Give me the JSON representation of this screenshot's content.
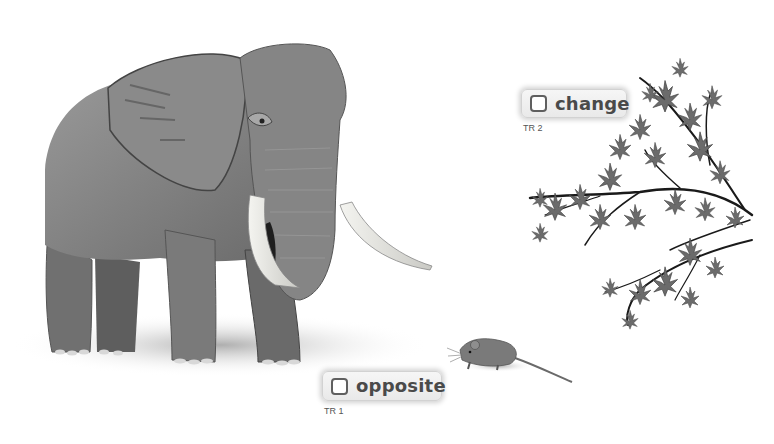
{
  "vocabulary": [
    {
      "word": "change",
      "track": "TR 2",
      "illustration": "maple-branch"
    },
    {
      "word": "opposite",
      "track": "TR 1",
      "illustration": "elephant-and-mouse"
    }
  ],
  "illustrations": {
    "elephant": "elephant-illustration",
    "mouse": "mouse-illustration",
    "branch": "maple-branch-illustration"
  },
  "colors": {
    "elephant_body": "#7c7c7c",
    "elephant_dark": "#555555",
    "tusk": "#e9e9e4",
    "leaf": "#6e6e6e",
    "branch": "#1a1a1a",
    "card_bg": "#eeeeee",
    "card_text": "#4a4a4a"
  }
}
